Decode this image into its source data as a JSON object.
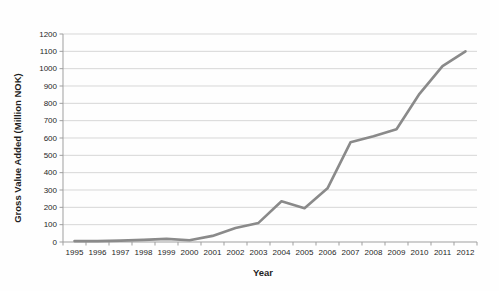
{
  "chart_data": {
    "type": "line",
    "title": "",
    "xlabel": "Year",
    "ylabel": "Gross Value Added (Million NOK)",
    "categories": [
      "1995",
      "1996",
      "1997",
      "1998",
      "1999",
      "2000",
      "2001",
      "2002",
      "2003",
      "2004",
      "2005",
      "2006",
      "2007",
      "2008",
      "2009",
      "2010",
      "2011",
      "2012"
    ],
    "series": [
      {
        "name": "Gross Value Added",
        "values": [
          5,
          5,
          8,
          12,
          18,
          10,
          35,
          80,
          110,
          235,
          195,
          310,
          575,
          610,
          650,
          855,
          1015,
          1100
        ]
      }
    ],
    "ylim": [
      0,
      1200
    ],
    "ytick_step": 100,
    "grid": "horizontal",
    "legend": "none",
    "colors": {
      "line": "#8a8a8a",
      "gridline": "#d7d7d7",
      "axis": "#9f9f9f",
      "tick_text": "#1f1f1f"
    }
  }
}
